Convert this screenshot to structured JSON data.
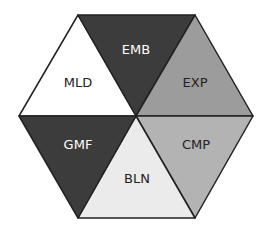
{
  "diagram": {
    "type": "hexagon-segments",
    "segments": [
      {
        "id": "mld",
        "label": "MLD",
        "fill": "#ffffff",
        "text_color": "#222222"
      },
      {
        "id": "emb",
        "label": "EMB",
        "fill": "#3c3c3c",
        "text_color": "#ffffff"
      },
      {
        "id": "exp",
        "label": "EXP",
        "fill": "#9c9c9c",
        "text_color": "#222222"
      },
      {
        "id": "cmp",
        "label": "CMP",
        "fill": "#b3b3b3",
        "text_color": "#222222"
      },
      {
        "id": "bln",
        "label": "BLN",
        "fill": "#ebebeb",
        "text_color": "#222222"
      },
      {
        "id": "gmf",
        "label": "GMF",
        "fill": "#3c3c3c",
        "text_color": "#ffffff"
      }
    ],
    "stroke_color": "#222222"
  }
}
